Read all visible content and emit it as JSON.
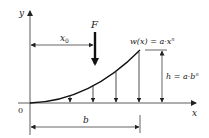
{
  "diagram": {
    "type": "beam-load-diagram",
    "colors": {
      "line": "#222222",
      "axis": "#333333",
      "curve": "#111111",
      "background": "#ffffff"
    },
    "axes": {
      "x_label": "x",
      "y_label": "y",
      "origin_label": "0"
    },
    "force": {
      "label": "F",
      "direction": "down"
    },
    "dimensions": {
      "x0_label": "x",
      "x0_subscript": "0",
      "b_label": "b",
      "h_label": "h = a·b",
      "h_exponent": "n"
    },
    "curve": {
      "label": "w(x) = a·x",
      "exponent": "n"
    },
    "load_arrows_count": 4
  }
}
